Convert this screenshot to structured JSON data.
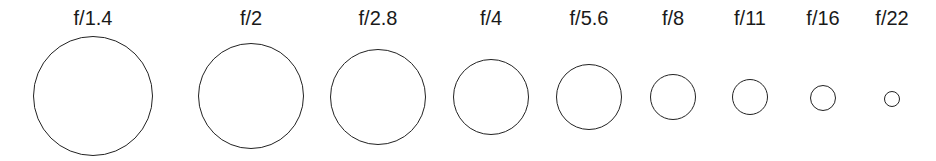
{
  "diagram": {
    "stroke_color": "#222222",
    "label_color": "#1a1a1a",
    "stops": [
      {
        "label": "f/1.4",
        "cx": 93,
        "cy": 96,
        "r": 60
      },
      {
        "label": "f/2",
        "cx": 251,
        "cy": 96,
        "r": 53
      },
      {
        "label": "f/2.8",
        "cx": 378,
        "cy": 97,
        "r": 48
      },
      {
        "label": "f/4",
        "cx": 491,
        "cy": 97,
        "r": 38
      },
      {
        "label": "f/5.6",
        "cx": 589,
        "cy": 97,
        "r": 33
      },
      {
        "label": "f/8",
        "cx": 673,
        "cy": 97,
        "r": 23
      },
      {
        "label": "f/11",
        "cx": 750,
        "cy": 97,
        "r": 18
      },
      {
        "label": "f/16",
        "cx": 823,
        "cy": 98,
        "r": 13
      },
      {
        "label": "f/22",
        "cx": 892,
        "cy": 99,
        "r": 8
      }
    ]
  }
}
